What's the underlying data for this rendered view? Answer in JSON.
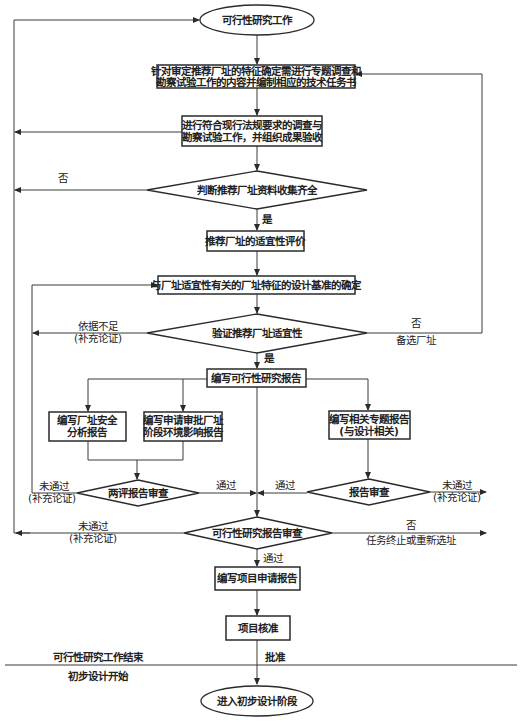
{
  "flowchart": {
    "start": "可行性研究工作",
    "step1": [
      "针对审定推荐厂址的特征确定需进行专题调查和",
      "勘察试验工作的内容并编制相应的技术任务书"
    ],
    "step2": [
      "进行符合现行法规要求的调查与",
      "勘察试验工作，并组织成果验收"
    ],
    "decision1": "判断推荐厂址资料收集齐全",
    "decision1_no": "否",
    "decision1_yes": "是",
    "step3": "推荐厂址的适宜性评价",
    "step4": "与厂址适宜性有关的厂址特征的设计基准的确定",
    "decision2": "验证推荐厂址适宜性",
    "decision2_left": [
      "依据不足",
      "(补充论证)"
    ],
    "decision2_right": [
      "否",
      "备选厂址"
    ],
    "decision2_yes": "是",
    "step5": "编写可行性研究报告",
    "step6": [
      "编写厂址安全",
      "分析报告"
    ],
    "step7": [
      "编写申请审批厂址",
      "阶段环境影响报告"
    ],
    "step8": [
      "编写相关专题报告",
      "(与设计相关)"
    ],
    "decision3": "两评报告审查",
    "decision3_fail": [
      "未通过",
      "(补充论证)"
    ],
    "decision3_pass": "通过",
    "decision4": "报告审查",
    "decision4_pass": "通过",
    "decision4_fail": [
      "未通过",
      "(补充论证)"
    ],
    "decision5": "可行性研究报告审查",
    "decision5_fail": [
      "未通过",
      "(补充论证)"
    ],
    "decision5_no": [
      "否",
      "任务终止或重新选址"
    ],
    "decision5_pass": "通过",
    "step9": "编写项目申请报告",
    "step10": "项目核准",
    "approve": "批准",
    "phase_end": "可行性研究工作结束",
    "phase_start": "初步设计开始",
    "end": "进入初步设计阶段"
  }
}
